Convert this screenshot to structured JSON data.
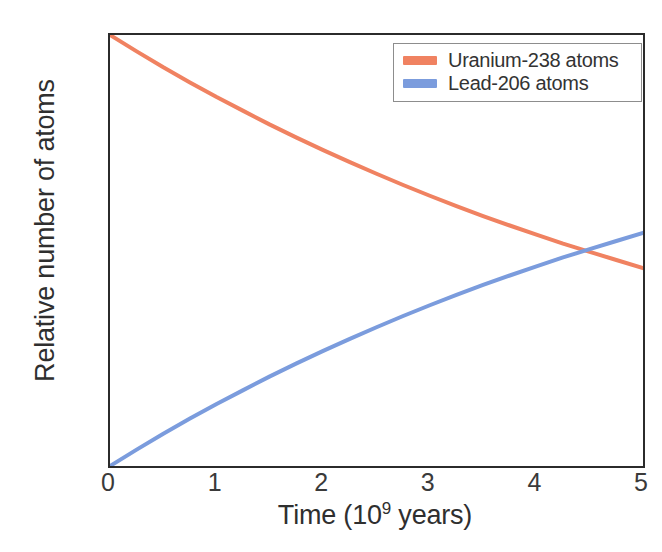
{
  "chart_data": {
    "type": "line",
    "title": "",
    "xlabel": "Time (10^9 years)",
    "xlabel_base": "Time (10",
    "xlabel_exponent": "9",
    "xlabel_tail": " years)",
    "ylabel": "Relative number of atoms",
    "xlim": [
      0,
      5
    ],
    "ylim": [
      0.0,
      1.0
    ],
    "xticks": [
      "0",
      "1",
      "2",
      "3",
      "4",
      "5"
    ],
    "xtick_values": [
      0,
      1,
      2,
      3,
      4,
      5
    ],
    "yticks": [
      "0.0",
      "0.2",
      "0.4",
      "0.6",
      "0.8",
      "1.0"
    ],
    "ytick_values": [
      0.0,
      0.2,
      0.4,
      0.6,
      0.8,
      1.0
    ],
    "grid": false,
    "legend_position": "upper right",
    "half_life": 4.468,
    "crossover": {
      "x": 4.47,
      "y": 0.5
    },
    "x": [
      0,
      0.25,
      0.5,
      0.75,
      1,
      1.25,
      1.5,
      1.75,
      2,
      2.25,
      2.5,
      2.75,
      3,
      3.25,
      3.5,
      3.75,
      4,
      4.25,
      4.5,
      4.75,
      5
    ],
    "series": [
      {
        "name": "Uranium-238 atoms",
        "color": "#F08261",
        "values": [
          1.0,
          0.962,
          0.925,
          0.89,
          0.856,
          0.824,
          0.792,
          0.762,
          0.733,
          0.705,
          0.678,
          0.652,
          0.627,
          0.603,
          0.58,
          0.558,
          0.537,
          0.516,
          0.497,
          0.478,
          0.459
        ]
      },
      {
        "name": "Lead-206 atoms",
        "color": "#7B9CDD",
        "values": [
          0.0,
          0.038,
          0.075,
          0.11,
          0.144,
          0.176,
          0.208,
          0.238,
          0.267,
          0.295,
          0.322,
          0.348,
          0.373,
          0.397,
          0.42,
          0.442,
          0.463,
          0.484,
          0.503,
          0.522,
          0.541
        ]
      }
    ]
  },
  "legend": {
    "entries": [
      {
        "label": "Uranium-238 atoms",
        "color": "#F08261"
      },
      {
        "label": "Lead-206 atoms",
        "color": "#7B9CDD"
      }
    ]
  },
  "axes": {
    "frame_color": "#2b2b2b",
    "tick_color": "#3a3a3a"
  }
}
